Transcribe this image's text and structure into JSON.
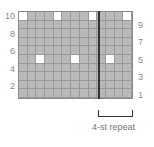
{
  "chart_data": {
    "type": "table",
    "columns": 13,
    "rows": 10,
    "row_labels_left": [
      "10",
      "8",
      "6",
      "4",
      "2"
    ],
    "row_labels_right": [
      "9",
      "7",
      "5",
      "3",
      "1"
    ],
    "white_cells": [
      {
        "row": 10,
        "cols": [
          1,
          5,
          9,
          13
        ]
      },
      {
        "row": 5,
        "cols": [
          3,
          7,
          11
        ]
      }
    ],
    "repeat": {
      "start_col": 10,
      "end_col": 13,
      "label": "4-st repeat"
    },
    "colors": {
      "background_cell": "#b9b9b9",
      "highlight_cell": "#ffffff",
      "repeat_line": "#333333"
    }
  },
  "labels": {
    "left": [
      "10",
      "8",
      "6",
      "4",
      "2"
    ],
    "right": [
      "9",
      "7",
      "5",
      "3",
      "1"
    ],
    "repeat": "4-st repeat"
  }
}
